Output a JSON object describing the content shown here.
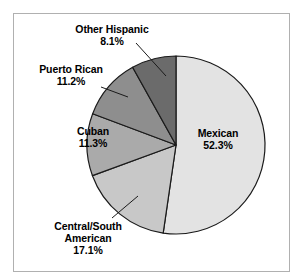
{
  "figure": {
    "background_color": "#ffffff",
    "frame_color": "#b0b0b0",
    "outline_color": "#1a1a1a"
  },
  "chart_data": {
    "type": "pie",
    "title": "",
    "subtitle": "",
    "xlabel": "",
    "ylabel": "",
    "grid": false,
    "legend_position": "none",
    "label_style": "outside-with-leader-lines-and-inside-labels",
    "units": "percent",
    "total": 100.0,
    "start_angle_deg": 0,
    "direction": "clockwise",
    "categories": [
      "Mexican",
      "Central/South American",
      "Cuban",
      "Puerto Rican",
      "Other Hispanic"
    ],
    "values": [
      52.3,
      17.1,
      11.3,
      11.2,
      8.1
    ],
    "slices": [
      {
        "id": "mexican",
        "label": "Mexican",
        "label_lines": [
          "Mexican"
        ],
        "percent_text": "52.3%",
        "value": 52.3,
        "color": "#e3e3e3",
        "label_placement": "inside"
      },
      {
        "id": "central-south-american",
        "label": "Central/South American",
        "label_lines": [
          "Central/South",
          "American"
        ],
        "percent_text": "17.1%",
        "value": 17.1,
        "color": "#c8c8c8",
        "label_placement": "outside"
      },
      {
        "id": "cuban",
        "label": "Cuban",
        "label_lines": [
          "Cuban"
        ],
        "percent_text": "11.3%",
        "value": 11.3,
        "color": "#aaaaaa",
        "label_placement": "inside"
      },
      {
        "id": "puerto-rican",
        "label": "Puerto Rican",
        "label_lines": [
          "Puerto Rican"
        ],
        "percent_text": "11.2%",
        "value": 11.2,
        "color": "#8e8e8e",
        "label_placement": "outside"
      },
      {
        "id": "other-hispanic",
        "label": "Other Hispanic",
        "label_lines": [
          "Other Hispanic"
        ],
        "percent_text": "8.1%",
        "value": 8.1,
        "color": "#6b6b6b",
        "label_placement": "outside"
      }
    ]
  },
  "labels": {
    "mexican": {
      "name": "Mexican",
      "pct": "52.3%"
    },
    "central_south": {
      "name_line1": "Central/South",
      "name_line2": "American",
      "pct": "17.1%"
    },
    "cuban": {
      "name": "Cuban",
      "pct": "11.3%"
    },
    "puerto_rican": {
      "name": "Puerto Rican",
      "pct": "11.2%"
    },
    "other_hispanic": {
      "name": "Other Hispanic",
      "pct": "8.1%"
    }
  }
}
